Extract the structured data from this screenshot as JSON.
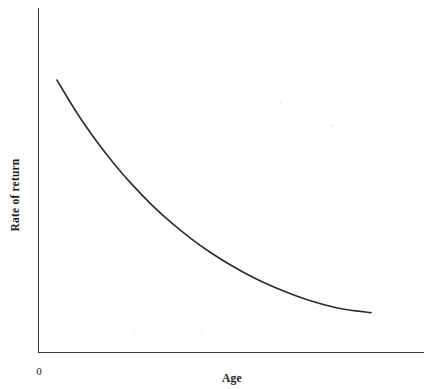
{
  "figure": {
    "background_color": "#fefefe",
    "width": 429,
    "height": 389
  },
  "labels": {
    "ylabel": "Rate of return",
    "xlabel": "Age",
    "origin": "0"
  },
  "chart_data": {
    "type": "line",
    "title": "",
    "subtitle": "",
    "xlabel": "Age",
    "ylabel": "Rate of return",
    "legend": [],
    "legend_position": "none",
    "grid": false,
    "axis_style": "open-L",
    "xlim": [
      0,
      1
    ],
    "ylim": [
      0,
      1
    ],
    "xticks": [],
    "yticks": [],
    "xtick_labels": [],
    "ytick_labels": [],
    "annotations": [
      {
        "text": "0",
        "x": 0,
        "y": 0,
        "note": "origin marker below axis corner"
      }
    ],
    "series": [
      {
        "name": "Rate of return",
        "color": "#2b2b2b",
        "linewidth": 1.6,
        "x": [
          0.05,
          0.1,
          0.15,
          0.2,
          0.25,
          0.3,
          0.35,
          0.4,
          0.45,
          0.5,
          0.55,
          0.6,
          0.65,
          0.7,
          0.75,
          0.8,
          0.87
        ],
        "y": [
          0.815,
          0.72,
          0.637,
          0.563,
          0.497,
          0.438,
          0.386,
          0.34,
          0.299,
          0.263,
          0.231,
          0.203,
          0.179,
          0.158,
          0.141,
          0.128,
          0.118
        ]
      }
    ]
  },
  "geometry": {
    "y_axis_x": 38,
    "y_axis_top": 8,
    "x_axis_y": 352,
    "x_axis_right": 424,
    "curve_start": [
      57,
      73
    ],
    "curve_end": [
      371,
      323
    ]
  },
  "colors": {
    "axis": "#3a3a3a",
    "curve": "#2b2b2b",
    "text": "#1c1c1c",
    "background": "#fefefe"
  }
}
